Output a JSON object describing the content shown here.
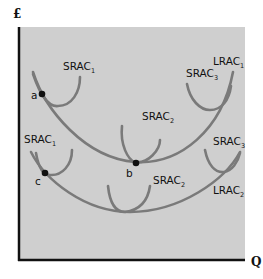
{
  "axes": {
    "y_label": "£",
    "x_label": "Q"
  },
  "colors": {
    "background": "#ffffff",
    "plot_area": "#cfcfcf",
    "curve": "#7a7a7a",
    "axis": "#111111",
    "point": "#111111"
  },
  "upper_set": {
    "srac1": {
      "label": "SRAC",
      "sub": "1"
    },
    "srac2": {
      "label": "SRAC",
      "sub": "2"
    },
    "srac3": {
      "label": "SRAC",
      "sub": "3"
    },
    "lrac": {
      "label": "LRAC",
      "sub": "1"
    },
    "points": {
      "a": "a",
      "b": "b"
    }
  },
  "lower_set": {
    "srac1": {
      "label": "SRAC",
      "sub": "1"
    },
    "srac2": {
      "label": "SRAC",
      "sub": "2"
    },
    "srac3": {
      "label": "SRAC",
      "sub": "3"
    },
    "lrac": {
      "label": "LRAC",
      "sub": "2"
    },
    "points": {
      "c": "c"
    }
  }
}
